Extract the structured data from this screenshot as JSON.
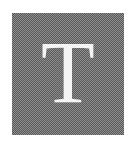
{
  "icon": {
    "name": "text-type-icon",
    "letter": "T",
    "background_color": "#5a5a5a",
    "pattern_color": "#8e8e8e",
    "letter_color": "#f4f4f4"
  }
}
